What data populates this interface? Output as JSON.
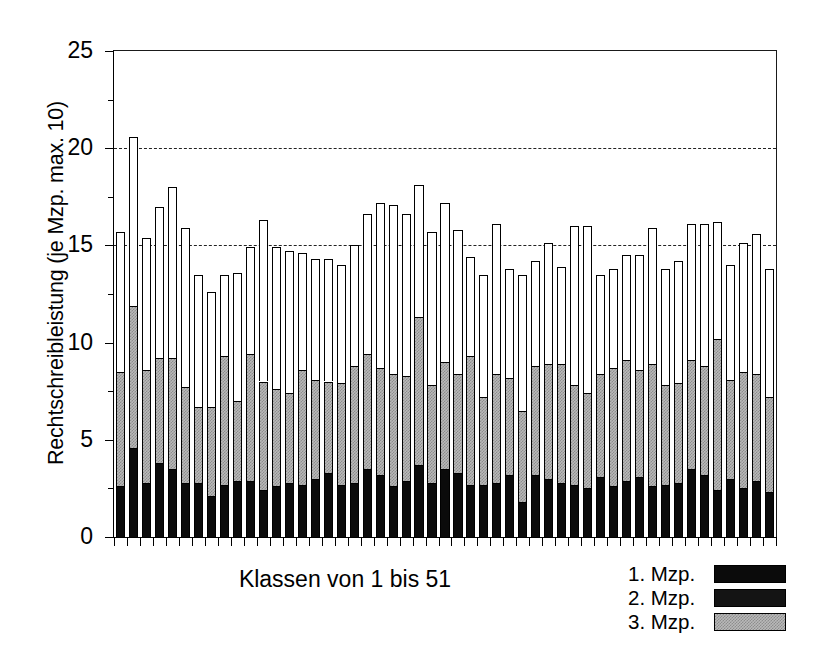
{
  "chart_data": {
    "type": "bar",
    "stacked": true,
    "title": "",
    "xlabel": "Klassen von 1 bis 51",
    "ylabel": "Rechtschreibleistung (je Mzp. max. 10)",
    "ylim": [
      0,
      25
    ],
    "yticks": [
      0,
      5,
      10,
      15,
      20,
      25
    ],
    "ytick_labels": [
      "0",
      "5",
      "10",
      "15",
      "20",
      "25"
    ],
    "yminor_ticks": [
      2.5,
      7.5,
      12.5,
      17.5,
      22.5
    ],
    "grid": true,
    "gridlines": [
      15,
      20
    ],
    "grid_style": "dashed",
    "legend_position": "bottom-right",
    "xtick_labels": [],
    "n_categories": 51,
    "categories": [
      1,
      2,
      3,
      4,
      5,
      6,
      7,
      8,
      9,
      10,
      11,
      12,
      13,
      14,
      15,
      16,
      17,
      18,
      19,
      20,
      21,
      22,
      23,
      24,
      25,
      26,
      27,
      28,
      29,
      30,
      31,
      32,
      33,
      34,
      35,
      36,
      37,
      38,
      39,
      40,
      41,
      42,
      43,
      44,
      45,
      46,
      47,
      48,
      49,
      50,
      51
    ],
    "series": [
      {
        "name": "1. Mzp.",
        "color": "#0b0b0b",
        "values": [
          2.6,
          4.6,
          2.8,
          3.8,
          3.5,
          2.8,
          2.8,
          2.1,
          2.7,
          2.9,
          2.9,
          2.4,
          2.6,
          2.8,
          2.7,
          3.0,
          3.3,
          2.7,
          2.8,
          3.5,
          3.2,
          2.6,
          2.9,
          3.7,
          2.8,
          3.5,
          3.3,
          2.7,
          2.7,
          2.8,
          3.2,
          1.8,
          3.2,
          3.0,
          2.8,
          2.7,
          2.5,
          3.1,
          2.6,
          2.9,
          3.1,
          2.6,
          2.7,
          2.8,
          3.5,
          3.2,
          2.4,
          3.0,
          2.5,
          2.9,
          2.3
        ]
      },
      {
        "name": "2. Mzp.",
        "color": "#141414",
        "values": [
          0.0,
          0.0,
          0.0,
          0.0,
          0.0,
          0.0,
          0.0,
          0.0,
          0.0,
          0.0,
          0.0,
          0.0,
          0.0,
          0.0,
          0.0,
          0.0,
          0.0,
          0.0,
          0.0,
          0.0,
          0.0,
          0.0,
          0.0,
          0.0,
          0.0,
          0.0,
          0.0,
          0.0,
          0.0,
          0.0,
          0.0,
          0.0,
          0.0,
          0.0,
          0.0,
          0.0,
          0.0,
          0.0,
          0.0,
          0.0,
          0.0,
          0.0,
          0.0,
          0.0,
          0.0,
          0.0,
          0.0,
          0.0,
          0.0,
          0.0,
          0.0
        ]
      },
      {
        "name": "3. Mzp.",
        "color": "#b9b9b9",
        "values": [
          5.9,
          7.3,
          5.8,
          5.4,
          5.7,
          4.9,
          3.9,
          4.6,
          6.6,
          4.1,
          6.5,
          5.6,
          5.0,
          4.6,
          5.9,
          5.1,
          4.7,
          5.2,
          6.0,
          5.9,
          5.5,
          5.8,
          5.4,
          7.6,
          5.0,
          5.5,
          5.1,
          6.6,
          4.5,
          5.6,
          5.0,
          4.7,
          5.6,
          5.9,
          6.1,
          5.1,
          4.9,
          5.3,
          6.1,
          6.2,
          5.5,
          6.3,
          5.1,
          5.1,
          5.6,
          5.6,
          7.8,
          5.1,
          6.0,
          5.5,
          4.9
        ]
      },
      {
        "name": "rest",
        "color": "#ffffff",
        "values": [
          7.2,
          8.7,
          6.8,
          7.8,
          8.8,
          8.2,
          6.8,
          5.9,
          4.2,
          6.6,
          5.5,
          8.3,
          7.3,
          7.3,
          6.0,
          6.2,
          6.3,
          6.1,
          6.2,
          7.2,
          8.5,
          8.7,
          8.3,
          6.8,
          7.9,
          8.2,
          7.4,
          5.1,
          6.3,
          7.7,
          5.6,
          7.0,
          5.4,
          6.2,
          5.0,
          8.2,
          8.6,
          5.1,
          5.1,
          5.4,
          5.9,
          7.0,
          6.0,
          6.3,
          7.0,
          7.3,
          6.0,
          5.9,
          6.6,
          7.2,
          6.6
        ]
      }
    ],
    "totals": [
      15.7,
      20.6,
      15.4,
      17.0,
      18.0,
      15.9,
      13.5,
      12.6,
      13.5,
      13.6,
      14.9,
      16.3,
      14.9,
      14.7,
      14.6,
      14.3,
      14.3,
      14.0,
      15.0,
      16.6,
      17.2,
      17.1,
      16.6,
      18.1,
      15.7,
      17.2,
      15.8,
      14.4,
      13.5,
      16.1,
      13.8,
      13.5,
      14.2,
      15.1,
      13.9,
      16.0,
      16.0,
      13.5,
      13.8,
      14.5,
      14.5,
      15.9,
      13.8,
      14.2,
      16.1,
      16.1,
      16.2,
      14.0,
      15.1,
      15.6,
      13.8
    ]
  },
  "legend": {
    "items": [
      {
        "label": "1. Mzp.",
        "swatch": "black"
      },
      {
        "label": "2. Mzp.",
        "swatch": "dark"
      },
      {
        "label": "3. Mzp.",
        "swatch": "gray-hatch"
      }
    ]
  }
}
